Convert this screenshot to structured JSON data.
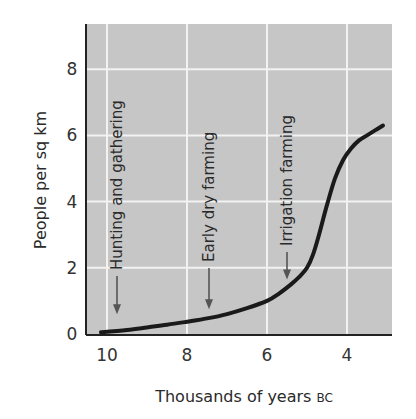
{
  "chart_data": {
    "type": "line",
    "title": "",
    "xlabel": "Thousands of years",
    "xlabel_suffix": "BC",
    "ylabel": "People per sq km",
    "x_reversed": true,
    "xlim": [
      10.5,
      2.9
    ],
    "ylim": [
      0,
      9.3
    ],
    "xticks": [
      10,
      8,
      6,
      4
    ],
    "yticks": [
      0,
      2,
      4,
      6,
      8
    ],
    "grid": true,
    "legend": null,
    "series": [
      {
        "name": "Population density",
        "x": [
          10.15,
          9.5,
          9.0,
          8.5,
          8.0,
          7.5,
          7.0,
          6.5,
          6.0,
          5.7,
          5.4,
          5.2,
          5.0,
          4.85,
          4.7,
          4.5,
          4.3,
          4.1,
          3.9,
          3.7,
          3.5,
          3.3,
          3.1
        ],
        "y": [
          0.05,
          0.12,
          0.2,
          0.28,
          0.37,
          0.47,
          0.6,
          0.78,
          1.0,
          1.22,
          1.5,
          1.72,
          2.0,
          2.4,
          3.0,
          3.9,
          4.7,
          5.25,
          5.6,
          5.85,
          6.0,
          6.15,
          6.3
        ]
      }
    ],
    "annotations": [
      {
        "text": "Hunting and gathering",
        "x": 9.75,
        "arrow_to_y": 0.6,
        "text_rotation": -90
      },
      {
        "text": "Early dry farming",
        "x": 7.45,
        "arrow_to_y": 0.75,
        "text_rotation": -90
      },
      {
        "text": "Irrigation farming",
        "x": 5.5,
        "arrow_to_y": 1.65,
        "text_rotation": -90
      }
    ],
    "colors": {
      "plot_background": "#c6c6c6",
      "grid": "#f2f2f2",
      "line": "#1a1a1a",
      "arrow": "#555555",
      "axis": "#222222"
    }
  }
}
